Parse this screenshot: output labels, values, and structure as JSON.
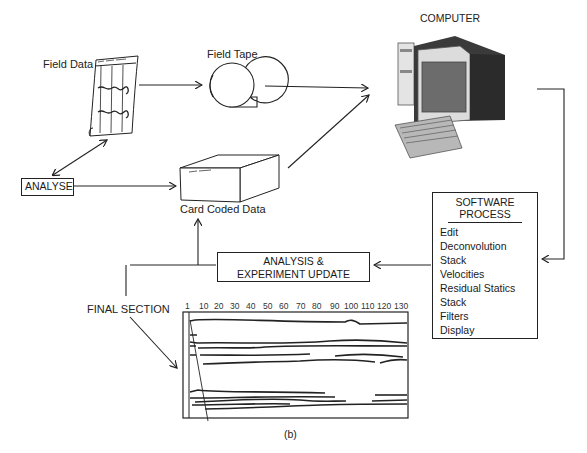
{
  "diagram": {
    "nodes": {
      "field_data": {
        "label": "Field Data",
        "scribble": "Field Records"
      },
      "field_tape": {
        "label": "Field Tape"
      },
      "computer": {
        "label": "COMPUTER"
      },
      "analyse": {
        "label": "ANALYSE"
      },
      "card_coded_data": {
        "label": "Card Coded Data",
        "scribble": "Job Stack"
      },
      "software_process": {
        "title_line1": "SOFTWARE",
        "title_line2": "PROCESS",
        "steps": [
          "Edit",
          "Deconvolution",
          "Stack",
          "Velocities",
          "Residual Statics",
          "Stack",
          "Filters",
          "Display"
        ]
      },
      "analysis_update": {
        "line1": "ANALYSIS &",
        "line2": "EXPERIMENT UPDATE"
      },
      "final_section": {
        "label": "FINAL SECTION",
        "axis_ticks": [
          "1",
          "10",
          "20",
          "30",
          "40",
          "50",
          "60",
          "70",
          "80",
          "90",
          "100",
          "110",
          "120",
          "130"
        ]
      }
    },
    "edges": [
      {
        "from": "field_data",
        "to": "field_tape"
      },
      {
        "from": "field_tape",
        "to": "computer"
      },
      {
        "from": "card_coded_data",
        "to": "computer"
      },
      {
        "from": "analyse",
        "to": "field_data",
        "bidirectional": true
      },
      {
        "from": "analyse",
        "to": "card_coded_data"
      },
      {
        "from": "computer",
        "to": "software_process"
      },
      {
        "from": "software_process",
        "to": "analysis_update"
      },
      {
        "from": "analysis_update",
        "to": "card_coded_data"
      },
      {
        "from": "final_section_label",
        "to": "final_section"
      }
    ],
    "caption": "(b)"
  }
}
